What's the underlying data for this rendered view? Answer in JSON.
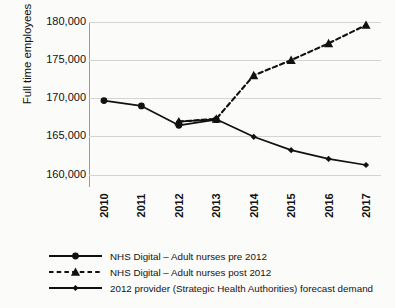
{
  "chart_data": {
    "type": "line",
    "title": "",
    "xlabel": "",
    "ylabel": "Full time employees",
    "categories": [
      "2010",
      "2011",
      "2012",
      "2013",
      "2014",
      "2015",
      "2016",
      "2017"
    ],
    "x": [
      2010,
      2011,
      2012,
      2013,
      2014,
      2015,
      2016,
      2017
    ],
    "ylim": [
      158500,
      180000
    ],
    "xlim": [
      2009.6,
      2017.4
    ],
    "y_ticks": [
      160000,
      165000,
      170000,
      175000,
      180000
    ],
    "y_tick_labels": [
      "160,000",
      "165,000",
      "170,000",
      "175,000",
      "180,000"
    ],
    "grid": "horizontal",
    "legend_position": "bottom-left",
    "series": [
      {
        "name": "NHS Digital – Adult nurses pre 2012",
        "marker": "circle",
        "line_style": "solid",
        "color": "#111111",
        "x": [
          2010,
          2011,
          2012,
          2013
        ],
        "values": [
          169700,
          169000,
          166450,
          167200
        ]
      },
      {
        "name": "NHS Digital – Adult nurses post 2012",
        "marker": "triangle",
        "line_style": "dashed",
        "color": "#111111",
        "x": [
          2012,
          2013,
          2014,
          2015,
          2016,
          2017
        ],
        "values": [
          166950,
          167300,
          173000,
          175000,
          177200,
          179600
        ]
      },
      {
        "name": "2012 provider (Strategic Health Authorities) forecast demand",
        "marker": "diamond",
        "line_style": "solid",
        "color": "#111111",
        "x": [
          2012,
          2013,
          2014,
          2015,
          2016,
          2017
        ],
        "values": [
          166950,
          167250,
          164950,
          163200,
          162050,
          161250
        ]
      }
    ]
  },
  "legend": {
    "items": [
      {
        "label": "NHS Digital – Adult nurses pre 2012",
        "marker": "circle",
        "line_style": "solid"
      },
      {
        "label": "NHS Digital – Adult nurses post 2012",
        "marker": "triangle",
        "line_style": "dashed"
      },
      {
        "label": "2012 provider (Strategic Health Authorities) forecast demand",
        "marker": "diamond",
        "line_style": "solid"
      }
    ]
  },
  "colors": {
    "ink": "#111111",
    "gridline": "#d4d4d4",
    "axis": "#9b9b9b",
    "background": "#fbfbfa"
  }
}
